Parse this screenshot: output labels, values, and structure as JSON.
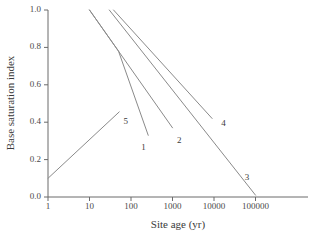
{
  "chart_data": {
    "type": "line",
    "title": "",
    "subtitle": "",
    "xlabel": "Site age (yr)",
    "ylabel": "Base saturation index",
    "xscale": "log",
    "yscale": "linear",
    "xlim": [
      1,
      300000
    ],
    "ylim": [
      0.0,
      1.0
    ],
    "grid": false,
    "legend": "none (inline numeric curve labels)",
    "xticks": [
      1,
      10,
      100,
      1000,
      10000,
      100000
    ],
    "xtick_labels": [
      "1",
      "10",
      "100",
      "1000",
      "10000",
      "100000"
    ],
    "yticks": [
      0.0,
      0.2,
      0.4,
      0.6,
      0.8,
      1.0
    ],
    "ytick_labels": [
      "0.0",
      "0.2",
      "0.4",
      "0.6",
      "0.8",
      "1.0"
    ],
    "series": [
      {
        "name": "1",
        "label": "1",
        "label_x": 200,
        "label_y": 0.26,
        "x": [
          10,
          50,
          260
        ],
        "y": [
          1.0,
          0.78,
          0.33
        ]
      },
      {
        "name": "2",
        "label": "2",
        "label_x": 1450,
        "label_y": 0.3,
        "x": [
          10,
          50,
          1000
        ],
        "y": [
          1.0,
          0.78,
          0.37
        ]
      },
      {
        "name": "3",
        "label": "3",
        "label_x": 62000,
        "label_y": 0.1,
        "x": [
          30,
          100000
        ],
        "y": [
          1.0,
          0.01
        ]
      },
      {
        "name": "4",
        "label": "4",
        "label_x": 17000,
        "label_y": 0.39,
        "x": [
          38,
          9000
        ],
        "y": [
          1.0,
          0.42
        ]
      },
      {
        "name": "5",
        "label": "5",
        "label_x": 75,
        "label_y": 0.4,
        "x": [
          1,
          52
        ],
        "y": [
          0.1,
          0.455
        ]
      }
    ]
  }
}
